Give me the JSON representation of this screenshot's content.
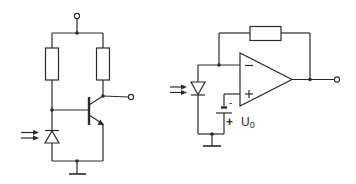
{
  "diagram": {
    "type": "circuit-schematic",
    "line_color": "#2a2a2a",
    "background": "#ffffff",
    "circuits": [
      {
        "name": "photodiode-transistor-amplifier",
        "components": [
          "supply-terminal",
          "base-resistor",
          "collector-resistor",
          "npn-transistor",
          "photodiode",
          "output-terminal",
          "ground"
        ]
      },
      {
        "name": "photodiode-transimpedance-amplifier",
        "components": [
          "feedback-resistor",
          "op-amp",
          "photodiode",
          "bias-battery",
          "output-terminal",
          "ground"
        ],
        "opamp": {
          "inverting_label": "−",
          "noninverting_label": "+"
        },
        "battery": {
          "minus_label": "-",
          "plus_label": "+",
          "voltage_label": "U",
          "voltage_subscript": "0"
        }
      }
    ]
  }
}
